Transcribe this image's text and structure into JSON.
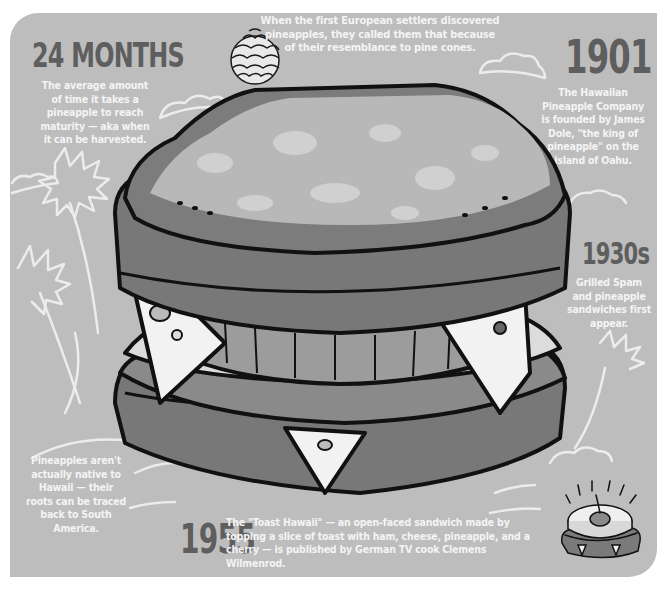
{
  "theme": {
    "panel_bg": "#bdbdbd",
    "headline_color": "#5e5e5e",
    "body_text_color": "#f4f4f4",
    "outline_color": "#111111"
  },
  "facts": {
    "months": {
      "headline": "24 MONTHS",
      "text": "The average amount of time it takes a pineapple to reach maturity — aka when it can be harvested."
    },
    "pinecone": {
      "icon": "pinecone-icon",
      "text": "When the first European settlers discovered pineapples, they called them that because of their resemblance to pine cones."
    },
    "y1901": {
      "headline": "1901",
      "text": "The Hawaiian Pineapple Company is founded by James Dole, \"the king of pineapple\" on the island of Oahu."
    },
    "y1930s": {
      "headline": "1930s",
      "text": "Grilled Spam and pineapple sandwiches first appear."
    },
    "native": {
      "text": "Pineapples aren't actually native to Hawaii — their roots can be traced back to South America."
    },
    "y1955": {
      "headline": "1955",
      "text": "The \"Toast Hawaii\" — an open-faced sandwich made by topping a slice of toast with ham, cheese, pineapple, and a cherry — is published by German TV cook Clemens Wilmenrod.",
      "icon": "toast-hawaii-icon"
    }
  },
  "illustration": {
    "main": "grilled-ham-cheese-pineapple-sandwich"
  }
}
